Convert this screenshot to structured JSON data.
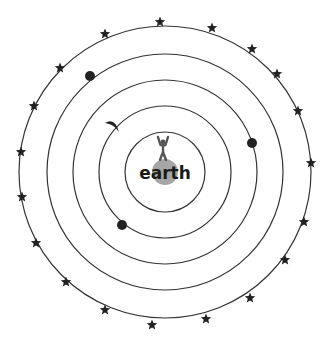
{
  "diagram": {
    "center": {
      "x": 165,
      "y": 172
    },
    "colors": {
      "orbit_stroke": "#333333",
      "earth_fill": "#a6a6a6",
      "body_fill": "#222222",
      "label": "#1a1a1a",
      "background": "#ffffff"
    },
    "earth": {
      "label": "earth",
      "radius": 13,
      "person_icon": "standing-person-arms-raised"
    },
    "orbits": [
      {
        "name": "orbit-1",
        "radius": 40
      },
      {
        "name": "orbit-2",
        "radius": 66,
        "body": {
          "type": "moon",
          "icon": "crescent-moon",
          "x": 113,
          "y": 127
        }
      },
      {
        "name": "orbit-3",
        "radius": 92,
        "body": {
          "type": "planet",
          "x": 252,
          "y": 143
        }
      },
      {
        "name": "orbit-4",
        "radius": 118,
        "body": {
          "type": "planet",
          "x": 90,
          "y": 76
        }
      },
      {
        "name": "orbit-5",
        "radius": 146,
        "body": {
          "type": "stars"
        }
      }
    ],
    "inner_planet": {
      "x": 122,
      "y": 225
    },
    "stars": [
      {
        "x": 160,
        "y": 22
      },
      {
        "x": 212,
        "y": 28
      },
      {
        "x": 252,
        "y": 49
      },
      {
        "x": 277,
        "y": 74
      },
      {
        "x": 298,
        "y": 111
      },
      {
        "x": 311,
        "y": 163
      },
      {
        "x": 304,
        "y": 222
      },
      {
        "x": 285,
        "y": 260
      },
      {
        "x": 250,
        "y": 298
      },
      {
        "x": 206,
        "y": 319
      },
      {
        "x": 152,
        "y": 325
      },
      {
        "x": 105,
        "y": 310
      },
      {
        "x": 66,
        "y": 282
      },
      {
        "x": 36,
        "y": 243
      },
      {
        "x": 22,
        "y": 197
      },
      {
        "x": 21,
        "y": 152
      },
      {
        "x": 34,
        "y": 106
      },
      {
        "x": 60,
        "y": 68
      },
      {
        "x": 105,
        "y": 34
      }
    ]
  }
}
